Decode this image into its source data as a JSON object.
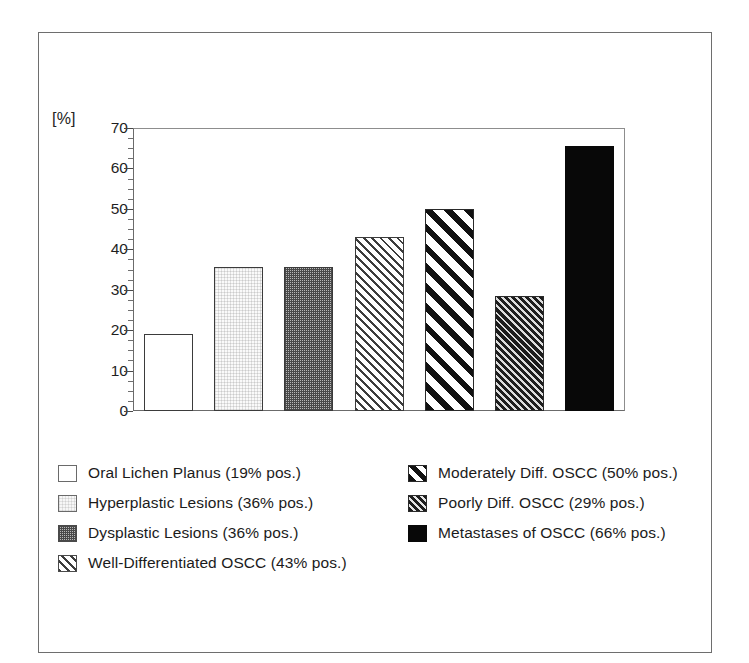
{
  "figure": {
    "axis_unit_label": "[%]",
    "frame_color": "#6e6e6e"
  },
  "chart_data": {
    "type": "bar",
    "title": "",
    "xlabel": "",
    "ylabel": "[%]",
    "ylim": [
      0,
      70
    ],
    "yticks": [
      0,
      10,
      20,
      30,
      40,
      50,
      60,
      70
    ],
    "ytick_labels": [
      "0",
      "10",
      "20",
      "30",
      "40",
      "50",
      "60",
      "70"
    ],
    "minor_tick_step": 2.5,
    "grid": false,
    "legend_position": "below-plot-two-columns",
    "categories": [
      "Oral Lichen Planus",
      "Hyperplastic Lesions",
      "Dysplastic Lesions",
      "Well-Differentiated OSCC",
      "Moderately Diff. OSCC",
      "Poorly Diff. OSCC",
      "Metastases of OSCC"
    ],
    "values": [
      19,
      36,
      36,
      43,
      50,
      29,
      66
    ],
    "bar_plotted_heights": [
      19,
      35.5,
      35.5,
      43,
      50,
      28.5,
      65.5
    ],
    "patterns": [
      "empty-white",
      "very-light-stipple",
      "dark-gray-checker",
      "light-diagonal-hatch",
      "bold-diagonal-stripe",
      "dense-diagonal-hatch",
      "solid-black"
    ]
  },
  "legend": {
    "left_column": [
      {
        "label": "Oral Lichen Planus (19% pos.)",
        "swatch": "empty-white"
      },
      {
        "label": "Hyperplastic Lesions  (36% pos.)",
        "swatch": "very-light-stipple"
      },
      {
        "label": "Dysplastic Lesions (36% pos.)",
        "swatch": "dark-gray-checker"
      },
      {
        "label": "Well-Differentiated OSCC (43% pos.)",
        "swatch": "light-diagonal-hatch"
      }
    ],
    "right_column": [
      {
        "label": "Moderately Diff.  OSCC (50% pos.)",
        "swatch": "bold-diagonal-stripe"
      },
      {
        "label": "Poorly Diff. OSCC (29% pos.)",
        "swatch": "dense-diagonal-hatch"
      },
      {
        "label": "Metastases of OSCC (66% pos.)",
        "swatch": "solid-black"
      }
    ]
  }
}
